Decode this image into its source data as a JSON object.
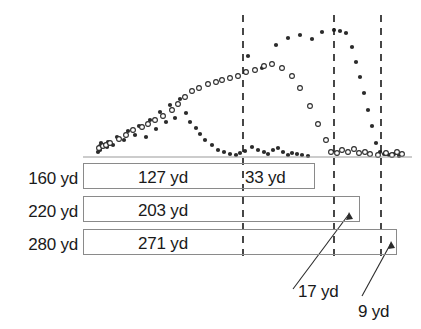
{
  "figure": {
    "title": "",
    "width": 421,
    "height": 329,
    "units": "yd"
  },
  "colors": {
    "ink": "#1a1a1a",
    "box_border": "#8a8a8a",
    "baseline": "#9a9a9a",
    "dashed_line": "#1a1a1a",
    "filled_marker": "#2b2b2b",
    "open_marker": "#2b2b2b",
    "background": "#ffffff"
  },
  "chart_data": {
    "type": "scatter",
    "title": "",
    "xlabel": "",
    "ylabel": "",
    "grid": false,
    "legend": null,
    "xlim": [
      0,
      421
    ],
    "ylim": [
      0,
      160
    ],
    "annotations": {
      "dashed_lines": [
        {
          "name": "line-160yd",
          "x": 243,
          "label": "160 yd"
        },
        {
          "name": "line-220yd",
          "x": 334,
          "label": "220 yd"
        },
        {
          "name": "line-280yd",
          "x": 381,
          "label": "280 yd"
        }
      ],
      "baseline_y": 157
    },
    "series": [
      {
        "name": "filled",
        "marker": "filled-circle",
        "points": [
          [
            98,
            152
          ],
          [
            100,
            150
          ],
          [
            100,
            146
          ],
          [
            101,
            143
          ],
          [
            107,
            147
          ],
          [
            108,
            142
          ],
          [
            113,
            145
          ],
          [
            117,
            137
          ],
          [
            124,
            140
          ],
          [
            128,
            131
          ],
          [
            135,
            135
          ],
          [
            139,
            126
          ],
          [
            146,
            137
          ],
          [
            150,
            120
          ],
          [
            156,
            129
          ],
          [
            160,
            112
          ],
          [
            166,
            122
          ],
          [
            170,
            105
          ],
          [
            175,
            118
          ],
          [
            180,
            99
          ],
          [
            186,
            113
          ],
          [
            190,
            122
          ],
          [
            196,
            128
          ],
          [
            200,
            134
          ],
          [
            205,
            140
          ],
          [
            212,
            145
          ],
          [
            218,
            150
          ],
          [
            224,
            152
          ],
          [
            230,
            154
          ],
          [
            236,
            155
          ],
          [
            240,
            153
          ],
          [
            245,
            151
          ],
          [
            252,
            147
          ],
          [
            258,
            150
          ],
          [
            264,
            152
          ],
          [
            268,
            154
          ],
          [
            273,
            150
          ],
          [
            278,
            148
          ],
          [
            283,
            152
          ],
          [
            288,
            155
          ],
          [
            292,
            153
          ],
          [
            297,
            154
          ],
          [
            302,
            155
          ],
          [
            308,
            156
          ],
          [
            248,
            56
          ],
          [
            262,
            68
          ],
          [
            276,
            45
          ],
          [
            288,
            38
          ],
          [
            300,
            35
          ],
          [
            312,
            39
          ],
          [
            322,
            32
          ],
          [
            334,
            30
          ],
          [
            340,
            31
          ],
          [
            346,
            33
          ],
          [
            352,
            47
          ],
          [
            356,
            62
          ],
          [
            360,
            77
          ],
          [
            364,
            93
          ],
          [
            368,
            110
          ],
          [
            372,
            126
          ],
          [
            376,
            143
          ],
          [
            380,
            152
          ],
          [
            384,
            154
          ],
          [
            389,
            155
          ],
          [
            394,
            154
          ],
          [
            399,
            156
          ]
        ]
      },
      {
        "name": "open",
        "marker": "open-circle",
        "points": [
          [
            99,
            148
          ],
          [
            103,
            146
          ],
          [
            106,
            145
          ],
          [
            110,
            143
          ],
          [
            119,
            139
          ],
          [
            126,
            135
          ],
          [
            133,
            130
          ],
          [
            142,
            127
          ],
          [
            148,
            124
          ],
          [
            155,
            120
          ],
          [
            163,
            116
          ],
          [
            172,
            110
          ],
          [
            178,
            104
          ],
          [
            185,
            97
          ],
          [
            192,
            91
          ],
          [
            199,
            88
          ],
          [
            208,
            84
          ],
          [
            216,
            82
          ],
          [
            222,
            80
          ],
          [
            230,
            78
          ],
          [
            238,
            76
          ],
          [
            246,
            72
          ],
          [
            255,
            70
          ],
          [
            264,
            66
          ],
          [
            272,
            64
          ],
          [
            282,
            68
          ],
          [
            292,
            76
          ],
          [
            300,
            88
          ],
          [
            310,
            106
          ],
          [
            318,
            124
          ],
          [
            326,
            140
          ],
          [
            331,
            152
          ],
          [
            337,
            153
          ],
          [
            342,
            150
          ],
          [
            348,
            152
          ],
          [
            354,
            149
          ],
          [
            359,
            153
          ],
          [
            365,
            152
          ],
          [
            370,
            154
          ],
          [
            378,
            155
          ],
          [
            386,
            153
          ],
          [
            392,
            155
          ],
          [
            397,
            152
          ],
          [
            402,
            154
          ]
        ]
      }
    ]
  },
  "bars": [
    {
      "name": "bar-160yd",
      "row_label": "160 yd",
      "segments": [
        {
          "name": "segment-127yd",
          "value": "127 yd"
        },
        {
          "name": "segment-33yd",
          "value": "33 yd"
        }
      ]
    },
    {
      "name": "bar-220yd",
      "row_label": "220 yd",
      "segments": [
        {
          "name": "segment-203yd",
          "value": "203 yd"
        }
      ]
    },
    {
      "name": "bar-280yd",
      "row_label": "280 yd",
      "segments": [
        {
          "name": "segment-271yd",
          "value": "271 yd"
        }
      ]
    }
  ],
  "callouts": [
    {
      "name": "callout-17yd",
      "text": "17 yd"
    },
    {
      "name": "callout-9yd",
      "text": "9 yd"
    }
  ]
}
